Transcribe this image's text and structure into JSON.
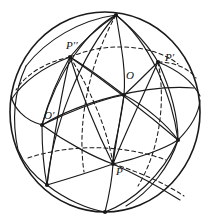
{
  "figure": {
    "kind": "geometric-diagram",
    "background_color": "#ffffff",
    "stroke_color": "#1a1a1a",
    "dashed_stroke_color": "#1a1a1a",
    "outline_width": 1.6,
    "arc_width": 1.15,
    "dash_pattern": "4,3"
  },
  "sphere": {
    "center_x": 105,
    "center_y": 112,
    "radius_x": 95,
    "radius_y": 100,
    "outline_name": "sphere-outline"
  },
  "labels": [
    {
      "id": "P2",
      "text": "P′′",
      "x": 66,
      "y": 40,
      "node_x": 70,
      "node_y": 57
    },
    {
      "id": "P1",
      "text": "P′",
      "x": 165,
      "y": 52,
      "node_x": 158,
      "node_y": 62
    },
    {
      "id": "O",
      "text": "O",
      "x": 126,
      "y": 70,
      "node_x": 124,
      "node_y": 95
    },
    {
      "id": "O2",
      "text": "O′",
      "x": 44,
      "y": 110,
      "node_x": 42,
      "node_y": 125
    },
    {
      "id": "P",
      "text": "P",
      "x": 116,
      "y": 166,
      "node_x": 113,
      "node_y": 164
    }
  ],
  "vertices": [
    {
      "id": "top",
      "x": 116,
      "y": 15
    },
    {
      "id": "P2",
      "x": 70,
      "y": 57
    },
    {
      "id": "P1",
      "x": 158,
      "y": 62
    },
    {
      "id": "O",
      "x": 124,
      "y": 95
    },
    {
      "id": "O2",
      "x": 42,
      "y": 125
    },
    {
      "id": "right",
      "x": 178,
      "y": 140
    },
    {
      "id": "P",
      "x": 113,
      "y": 164
    },
    {
      "id": "bottom-left",
      "x": 47,
      "y": 185
    },
    {
      "id": "bottom",
      "x": 105,
      "y": 212
    }
  ],
  "solid_arcs": [
    {
      "name": "arc-top-to-O2",
      "d": "M 116 15 C 88 30 58 70 42 125"
    },
    {
      "name": "arc-top-to-P2",
      "d": "M 116 15 C 100 26 82 42 70 57"
    },
    {
      "name": "arc-top-to-P1",
      "d": "M 116 15 C 134 30 150 48 158 62"
    },
    {
      "name": "arc-top-to-bottom-l",
      "d": "M 116 15 C 80 55 52 130 47 185"
    },
    {
      "name": "arc-top-through-O",
      "d": "M 116 15 C 122 50 126 72 124 95 C 120 130 112 150 113 164"
    },
    {
      "name": "arc-top-to-right",
      "d": "M 116 15 C 150 42 172 95 178 140"
    },
    {
      "name": "arc-P2-to-O",
      "d": "M 70 57 C 92 70 112 86 124 95"
    },
    {
      "name": "arc-P2-to-right",
      "d": "M 70 57 C 106 82 150 116 178 140"
    },
    {
      "name": "arc-P2-to-O2",
      "d": "M 70 57 C 58 78 48 102 42 125"
    },
    {
      "name": "arc-P2-to-P",
      "d": "M 70 57 C 82 96 100 138 113 164"
    },
    {
      "name": "arc-P2-to-bottom-l",
      "d": "M 70 57 C 60 100 52 150 47 185"
    },
    {
      "name": "arc-P1-to-O",
      "d": "M 158 62 C 146 74 132 88 124 95"
    },
    {
      "name": "arc-P1-to-P",
      "d": "M 158 62 C 142 98 122 140 113 164"
    },
    {
      "name": "arc-P1-to-right",
      "d": "M 158 62 C 170 88 178 116 178 140"
    },
    {
      "name": "arc-O-to-O2",
      "d": "M 124 95 C 98 100 64 114 42 125"
    },
    {
      "name": "arc-O-to-P",
      "d": "M 124 95 C 120 120 115 148 113 164"
    },
    {
      "name": "arc-O-to-right",
      "d": "M 124 95 C 146 106 168 126 178 140"
    },
    {
      "name": "arc-O2-to-P",
      "d": "M 42 125 C 68 144 96 158 113 164"
    },
    {
      "name": "arc-O2-to-bottom-l",
      "d": "M 42 125 C 42 148 44 170 47 185"
    },
    {
      "name": "arc-O2-equator-right",
      "d": "M 42 125 C 80 102 146 84 194 88"
    },
    {
      "name": "arc-P-to-bottom-l",
      "d": "M 113 164 C 90 172 64 180 47 185"
    },
    {
      "name": "arc-P-to-bottom",
      "d": "M 113 164 C 112 182 108 200 105 212"
    },
    {
      "name": "arc-P-to-right",
      "d": "M 113 164 C 140 158 166 148 178 140"
    },
    {
      "name": "arc-P-to-lower-right",
      "d": "M 113 164 C 140 176 164 190 180 200"
    },
    {
      "name": "arc-bottom-l-bottom",
      "d": "M 47 185 C 66 200 88 209 105 212"
    },
    {
      "name": "arc-right-to-bottom",
      "d": "M 178 140 C 162 176 132 202 105 212"
    },
    {
      "name": "arc-right-lower-1",
      "d": "M 178 140 C 170 166 150 192 126 206"
    },
    {
      "name": "arc-left-rim-1",
      "d": "M 42 125 C 24 120 14 108 11 96"
    },
    {
      "name": "arc-left-rim-2",
      "d": "M 70 57 C 46 66 24 80 11 100"
    },
    {
      "name": "arc-right-rim-1",
      "d": "M 158 62 C 178 70 192 80 200 96"
    },
    {
      "name": "arc-right-rim-2",
      "d": "M 178 140 C 192 126 199 112 200 100"
    },
    {
      "name": "arc-upper-left-rim",
      "d": "M 116 15 C 80 20 46 40 26 66"
    },
    {
      "name": "arc-far-left-vert",
      "d": "M 26 66 C 14 92 12 122 18 150"
    },
    {
      "name": "arc-lower-left-rim",
      "d": "M 47 185 C 34 176 24 164 18 150"
    }
  ],
  "dashed_arcs": [
    {
      "name": "dashed-equator-back",
      "d": "M 70 57 C 110 40 156 46 178 64"
    },
    {
      "name": "dashed-equator-left",
      "d": "M 70 57 C 46 62 26 74 16 90"
    },
    {
      "name": "dashed-back-meridian",
      "d": "M 116 15 C 92 58 76 118 84 172"
    },
    {
      "name": "dashed-back-mer-2",
      "d": "M 158 62 C 166 100 160 150 138 186"
    },
    {
      "name": "dashed-back-mer-3",
      "d": "M 70 57 C 92 92 108 132 113 164"
    },
    {
      "name": "dashed-low-equator",
      "d": "M 28 158 C 70 144 122 144 166 160"
    },
    {
      "name": "dashed-P-to-lower-r",
      "d": "M 113 164 C 140 172 166 184 184 196"
    },
    {
      "name": "dashed-upper-right",
      "d": "M 158 62 C 174 62 188 68 196 78"
    }
  ]
}
